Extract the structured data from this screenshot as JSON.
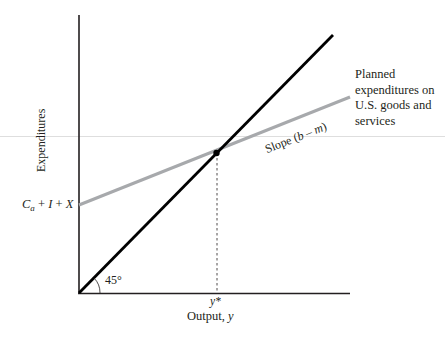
{
  "diagram": {
    "title": "",
    "y_axis_label": "Expenditures",
    "x_axis_label": "Output,",
    "x_axis_var": "y",
    "intercept_label": {
      "C": "C",
      "sub": "a",
      "rest_op1": " + ",
      "I": "I",
      "rest_op2": " + ",
      "X": "X"
    },
    "planned_label": "Planned expenditures on U.S. goods and services",
    "slope_label_prefix": "Slope (",
    "slope_label_b": "b",
    "slope_label_minus": " – ",
    "slope_label_m": "m",
    "slope_label_suffix": ")",
    "angle_label": "45°",
    "equilibrium_label": "y*",
    "colors": {
      "axis": "#231f20",
      "line_45": "#000000",
      "planned_line": "#a7a9ac",
      "dashed": "#231f20",
      "artifact_line": "#dcdcdc"
    },
    "lines": [
      {
        "name": "45-degree line",
        "from": [
          0,
          0
        ],
        "to": [
          1,
          1
        ]
      },
      {
        "name": "Planned expenditures",
        "intercept": "Ca + I + X",
        "slope": "b - m"
      }
    ],
    "equilibrium_point": {
      "x": "y*",
      "note": "intersection of 45-degree line and planned expenditures line"
    }
  }
}
